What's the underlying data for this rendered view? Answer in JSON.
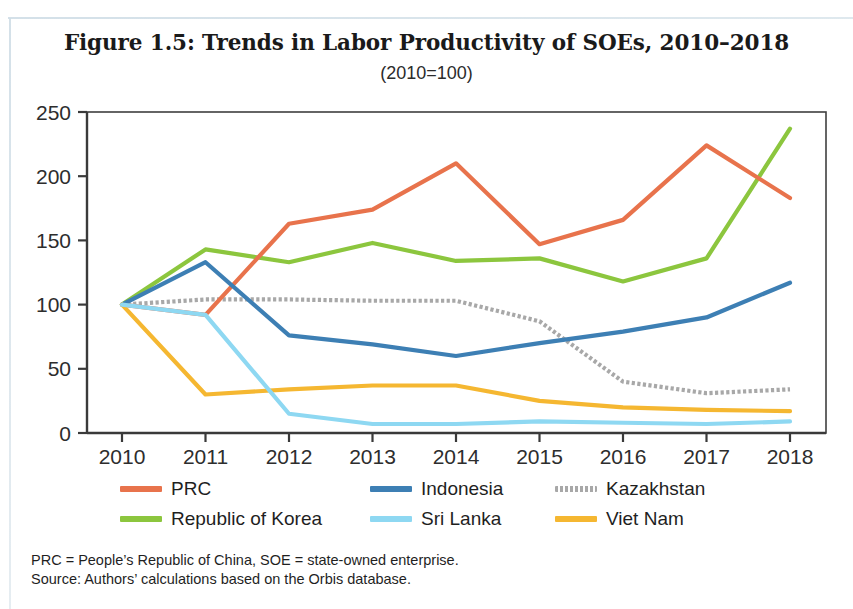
{
  "figure": {
    "title": "Figure 1.5: Trends in Labor Productivity of SOEs, 2010–2018",
    "subtitle": "(2010=100)"
  },
  "notes": {
    "abbreviations": "PRC = People’s Republic of China, SOE = state-owned enterprise.",
    "source": "Source: Authors’ calculations based on the Orbis database."
  },
  "legend": {
    "items": [
      {
        "label": "PRC",
        "color": "#e8734c",
        "style": "solid"
      },
      {
        "label": "Indonesia",
        "color": "#3d7fb4",
        "style": "solid"
      },
      {
        "label": "Kazakhstan",
        "color": "#a8a8a8",
        "style": "dotted"
      },
      {
        "label": "Republic of Korea",
        "color": "#8cc63e",
        "style": "solid"
      },
      {
        "label": "Sri Lanka",
        "color": "#8ed8f2",
        "style": "solid"
      },
      {
        "label": "Viet Nam",
        "color": "#f5b731",
        "style": "solid"
      }
    ]
  },
  "chart_data": {
    "type": "line",
    "title": "Figure 1.5: Trends in Labor Productivity of SOEs, 2010–2018",
    "subtitle": "(2010=100)",
    "xlabel": "",
    "ylabel": "",
    "x": [
      2010,
      2011,
      2012,
      2013,
      2014,
      2015,
      2016,
      2017,
      2018
    ],
    "xticklabels": [
      "2010",
      "2011",
      "2012",
      "2013",
      "2014",
      "2015",
      "2016",
      "2017",
      "2018"
    ],
    "yticks": [
      0,
      50,
      100,
      150,
      200,
      250
    ],
    "yticklabels": [
      "0",
      "50",
      "100",
      "150",
      "200",
      "250"
    ],
    "ylim": [
      0,
      250
    ],
    "grid": false,
    "legend_position": "bottom",
    "series": [
      {
        "name": "PRC",
        "color": "#e8734c",
        "style": "solid",
        "values": [
          100,
          92,
          163,
          174,
          210,
          147,
          166,
          224,
          183
        ]
      },
      {
        "name": "Republic of Korea",
        "color": "#8cc63e",
        "style": "solid",
        "values": [
          100,
          143,
          133,
          148,
          134,
          136,
          118,
          136,
          237
        ]
      },
      {
        "name": "Indonesia",
        "color": "#3d7fb4",
        "style": "solid",
        "values": [
          100,
          133,
          76,
          69,
          60,
          70,
          79,
          90,
          117
        ]
      },
      {
        "name": "Kazakhstan",
        "color": "#a8a8a8",
        "style": "dotted",
        "values": [
          100,
          104,
          104,
          103,
          103,
          87,
          40,
          31,
          34
        ]
      },
      {
        "name": "Sri Lanka",
        "color": "#8ed8f2",
        "style": "solid",
        "values": [
          100,
          92,
          15,
          7,
          7,
          9,
          8,
          7,
          9
        ]
      },
      {
        "name": "Viet Nam",
        "color": "#f5b731",
        "style": "solid",
        "values": [
          100,
          30,
          34,
          37,
          37,
          25,
          20,
          18,
          17
        ]
      }
    ]
  }
}
